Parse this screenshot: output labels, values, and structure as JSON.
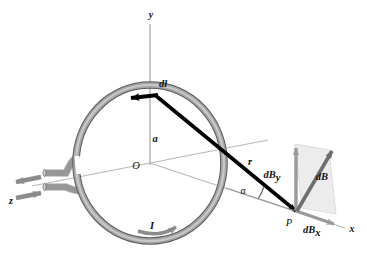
{
  "figure": {
    "background_color": "#ffffff"
  },
  "colors": {
    "loop_fill": "#9a9a9a",
    "loop_edge": "#5a5a5a",
    "axis_line": "#b9b9b9",
    "vector_black": "#000000",
    "vector_gray": "#6e6e6e",
    "shade_fill": "#ececec",
    "text": "#111111",
    "lead_fill": "#a8a8a8",
    "lead_edge": "#6a6a6a"
  },
  "axes": [
    {
      "id": "y",
      "label": "y",
      "direction": "up",
      "label_x": 151,
      "label_y": 16
    },
    {
      "id": "x",
      "label": "x",
      "direction": "right-down",
      "label_x": 352,
      "label_y": 230
    },
    {
      "id": "z",
      "label": "z",
      "direction": "left-out",
      "label_x": 11,
      "label_y": 202
    }
  ],
  "points": [
    {
      "id": "O",
      "label": "O",
      "label_x": 136,
      "label_y": 167,
      "desc": "origin-center-of-loop"
    },
    {
      "id": "P",
      "label": "P",
      "label_x": 289,
      "label_y": 224,
      "desc": "field-point-on-x-axis"
    }
  ],
  "lengths": [
    {
      "id": "a",
      "label": "a",
      "label_x": 155,
      "label_y": 140,
      "desc": "loop-radius"
    },
    {
      "id": "r",
      "label": "r",
      "label_x": 250,
      "label_y": 163,
      "desc": "distance-from-dl-to-P"
    }
  ],
  "angles": [
    {
      "id": "alpha",
      "label": "α",
      "label_x": 243,
      "label_y": 192,
      "desc": "angle-between-r-and-x-axis",
      "value_deg": 31
    }
  ],
  "vectors": [
    {
      "id": "dl",
      "label": "dl",
      "label_x": 163,
      "label_y": 85,
      "color": "#000000",
      "desc": "current-element-tangent-to-loop"
    },
    {
      "id": "r",
      "label": "r",
      "label_x": 250,
      "label_y": 163,
      "color": "#000000",
      "desc": "radius-vector-from-dl-to-P"
    },
    {
      "id": "dB",
      "label": "dB",
      "label_x": 322,
      "label_y": 178,
      "color": "#6e6e6e",
      "desc": "total-magnetic-field-contribution"
    },
    {
      "id": "dBy",
      "label": "dB",
      "sub": "y",
      "label_x": 272,
      "label_y": 176,
      "color": "#9a9a9a",
      "desc": "y-component-of-dB"
    },
    {
      "id": "dBx",
      "label": "dB",
      "sub": "x",
      "label_x": 303,
      "label_y": 231,
      "color": "#9a9a9a",
      "desc": "x-component-of-dB"
    }
  ],
  "current": {
    "label": "I",
    "label_x": 152,
    "label_y": 227,
    "desc": "current-direction-arrow-on-loop",
    "lead_arrows": [
      {
        "id": "lead-out",
        "direction": "left",
        "desc": "current-leaving-along-z"
      },
      {
        "id": "lead-in",
        "direction": "right",
        "desc": "current-entering-along-z"
      }
    ]
  },
  "loop": {
    "id": "current-loop",
    "center_x": 150,
    "center_y": 163,
    "radius_x": 74,
    "radius_y": 78,
    "tube_width": 6
  }
}
